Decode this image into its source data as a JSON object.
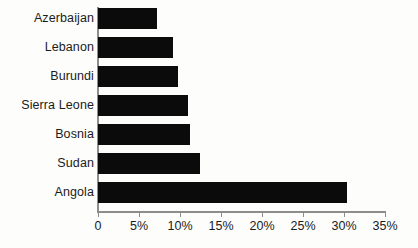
{
  "chart_data": {
    "type": "bar",
    "orientation": "horizontal",
    "title": "",
    "subtitle": "",
    "xlabel": "",
    "ylabel": "",
    "categories": [
      "Azerbaijan",
      "Lebanon",
      "Burundi",
      "Sierra Leone",
      "Bosnia",
      "Sudan",
      "Angola"
    ],
    "values": [
      7.2,
      9.1,
      9.8,
      11.0,
      11.2,
      12.4,
      30.4
    ],
    "value_unit": "%",
    "xlim": [
      0,
      35
    ],
    "xticks": [
      0,
      5,
      10,
      15,
      20,
      25,
      30,
      35
    ],
    "xtick_labels": [
      "0",
      "5%",
      "10%",
      "15%",
      "20%",
      "25%",
      "30%",
      "35%"
    ],
    "grid": false,
    "legend": false,
    "bar_color": "#0b0b0b",
    "axis_color": "#8d8d8d",
    "background_color": "#fdfdfb"
  }
}
